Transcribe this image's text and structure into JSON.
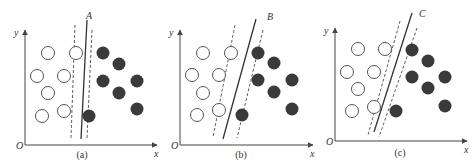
{
  "panels": [
    {
      "id": "a",
      "caption": "(a)",
      "boundary_label": "A",
      "axis_origin_label": "O",
      "axis_x_label": "x",
      "axis_y_label": "y",
      "origin": [
        25,
        145
      ],
      "x_end": 157,
      "y_top": 30,
      "open_points": [
        [
          48,
          53
        ],
        [
          76,
          53
        ],
        [
          37,
          76
        ],
        [
          64,
          76
        ],
        [
          48,
          93
        ],
        [
          42,
          116
        ],
        [
          64,
          111
        ]
      ],
      "filled_points": [
        [
          103,
          53
        ],
        [
          119,
          64
        ],
        [
          103,
          81
        ],
        [
          137,
          81
        ],
        [
          119,
          93
        ],
        [
          137,
          109
        ],
        [
          89,
          116
        ]
      ],
      "solid_line": [
        [
          87,
          20
        ],
        [
          81,
          139
        ]
      ],
      "dashed_left": [
        [
          75,
          25
        ],
        [
          71,
          138
        ]
      ],
      "dashed_right": [
        [
          92,
          30
        ],
        [
          87,
          138
        ]
      ],
      "label_pos": [
        86,
        19
      ],
      "caption_pos": [
        82,
        158
      ]
    },
    {
      "id": "b",
      "caption": "(b)",
      "boundary_label": "B",
      "axis_origin_label": "O",
      "axis_x_label": "x",
      "axis_y_label": "y",
      "origin": [
        180,
        145
      ],
      "x_end": 313,
      "y_top": 30,
      "open_points": [
        [
          203,
          53
        ],
        [
          231,
          53
        ],
        [
          192,
          75
        ],
        [
          219,
          75
        ],
        [
          203,
          93
        ],
        [
          197,
          115
        ],
        [
          219,
          110
        ]
      ],
      "filled_points": [
        [
          258,
          53
        ],
        [
          274,
          63
        ],
        [
          258,
          80
        ],
        [
          292,
          80
        ],
        [
          274,
          92
        ],
        [
          292,
          109
        ],
        [
          242,
          115
        ]
      ],
      "solid_line": [
        [
          256,
          19
        ],
        [
          223,
          139
        ]
      ],
      "dashed_left": [
        [
          235,
          25
        ],
        [
          213,
          137
        ]
      ],
      "dashed_right": [
        [
          263,
          30
        ],
        [
          237,
          138
        ]
      ],
      "label_pos": [
        267,
        20
      ],
      "caption_pos": [
        241,
        158
      ]
    },
    {
      "id": "c",
      "caption": "(c)",
      "boundary_label": "C",
      "axis_origin_label": "O",
      "axis_x_label": "x",
      "axis_y_label": "y",
      "origin": [
        335,
        141
      ],
      "x_end": 467,
      "y_top": 28,
      "open_points": [
        [
          358,
          49
        ],
        [
          385,
          49
        ],
        [
          347,
          72
        ],
        [
          374,
          72
        ],
        [
          358,
          89
        ],
        [
          352,
          111
        ],
        [
          374,
          107
        ]
      ],
      "filled_points": [
        [
          412,
          50
        ],
        [
          428,
          61
        ],
        [
          412,
          77
        ],
        [
          445,
          77
        ],
        [
          428,
          88
        ],
        [
          445,
          106
        ],
        [
          396,
          111
        ]
      ],
      "solid_line": [
        [
          412,
          13
        ],
        [
          374,
          132
        ]
      ],
      "dashed_left": [
        [
          400,
          21
        ],
        [
          368,
          135
        ]
      ],
      "dashed_right": [
        [
          417,
          28
        ],
        [
          379,
          137
        ]
      ],
      "label_pos": [
        419,
        17
      ],
      "caption_pos": [
        400,
        156
      ]
    }
  ],
  "style": {
    "point_radius": 6.5,
    "open_stroke": "#555555",
    "filled_color": "#3a3a3a",
    "line_color": "#333333",
    "axis_color": "#444444",
    "text_color": "#333333"
  }
}
